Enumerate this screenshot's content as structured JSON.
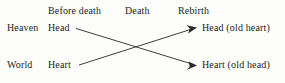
{
  "figure": {
    "background_color": "#fdfdfc",
    "ink_color": "#201e1e"
  },
  "column_headers": {
    "before_death": "Before death",
    "death": "Death",
    "rebirth": "Rebirth"
  },
  "row_labels": {
    "heaven": "Heaven",
    "world": "World"
  },
  "before_death_terms": {
    "heaven_row": "Head",
    "world_row": "Heart"
  },
  "rebirth_terms": {
    "heaven_row": "Head (old heart)",
    "world_row": "Heart (old head)"
  },
  "arrows": [
    {
      "name": "head-to-heart-arrow",
      "from": "Head",
      "to": "Heart (old head)",
      "direction": "down-right"
    },
    {
      "name": "heart-to-head-arrow",
      "from": "Heart",
      "to": "Head (old heart)",
      "direction": "up-right"
    }
  ]
}
